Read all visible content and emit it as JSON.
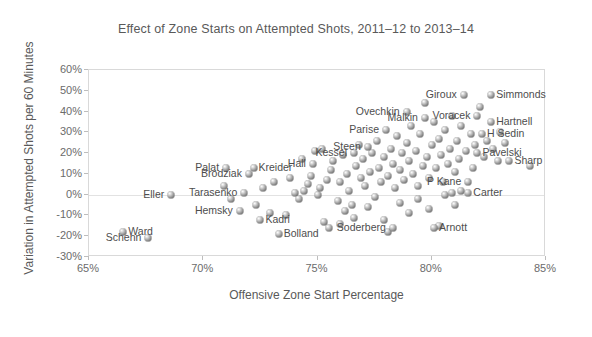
{
  "chart_data": {
    "type": "scatter",
    "title": "Effect of Zone Starts on Attempted Shots, 2011–12 to 2013–14",
    "xlabel": "Offensive Zone Start Percentage",
    "ylabel": "Variation in Attempted Shots per 60 Minutes",
    "xlim": [
      65,
      85
    ],
    "ylim": [
      -30,
      60
    ],
    "xticks": [
      "65%",
      "70%",
      "75%",
      "80%",
      "85%"
    ],
    "xtick_values": [
      65,
      70,
      75,
      80,
      85
    ],
    "yticks": [
      "60%",
      "50%",
      "40%",
      "30%",
      "20%",
      "10%",
      "0%",
      "-10%",
      "-20%",
      "-30%"
    ],
    "ytick_values": [
      60,
      50,
      40,
      30,
      20,
      10,
      0,
      -10,
      -20,
      -30
    ],
    "grid": "zero-line-only",
    "legend": "none",
    "marker_style": "grey-3d-sphere",
    "labeled_points": [
      {
        "name": "Ward",
        "x": 66.5,
        "y": -18,
        "side": "l"
      },
      {
        "name": "Schenn",
        "x": 67.6,
        "y": -21,
        "side": "r"
      },
      {
        "name": "Eller",
        "x": 68.6,
        "y": 0,
        "side": "r"
      },
      {
        "name": "Palat",
        "x": 71.0,
        "y": 13,
        "side": "r"
      },
      {
        "name": "Kreider",
        "x": 72.2,
        "y": 13,
        "side": "l"
      },
      {
        "name": "Brodziak",
        "x": 72.0,
        "y": 10,
        "side": "r"
      },
      {
        "name": "Tarasenko",
        "x": 71.8,
        "y": 1,
        "side": "r"
      },
      {
        "name": "Hemsky",
        "x": 71.6,
        "y": -8,
        "side": "r"
      },
      {
        "name": "Kadri",
        "x": 72.5,
        "y": -12,
        "side": "l"
      },
      {
        "name": "Bolland",
        "x": 73.3,
        "y": -19,
        "side": "l"
      },
      {
        "name": "Hall",
        "x": 74.8,
        "y": 15,
        "side": "r"
      },
      {
        "name": "Kessel",
        "x": 76.6,
        "y": 20,
        "side": "r"
      },
      {
        "name": "Steen",
        "x": 77.2,
        "y": 23,
        "side": "r"
      },
      {
        "name": "Parise",
        "x": 78.0,
        "y": 31,
        "side": "r"
      },
      {
        "name": "Ovechkin",
        "x": 78.9,
        "y": 40,
        "side": "r"
      },
      {
        "name": "Malkin",
        "x": 79.7,
        "y": 37,
        "side": "r"
      },
      {
        "name": "Soderberg",
        "x": 78.3,
        "y": -16,
        "side": "r"
      },
      {
        "name": "Arnott",
        "x": 80.1,
        "y": -16,
        "side": "l"
      },
      {
        "name": "Giroux",
        "x": 81.4,
        "y": 48,
        "side": "r"
      },
      {
        "name": "Simmonds",
        "x": 82.6,
        "y": 48,
        "side": "l"
      },
      {
        "name": "Voracek",
        "x": 82.0,
        "y": 38,
        "side": "r"
      },
      {
        "name": "Hartnell",
        "x": 82.6,
        "y": 35,
        "side": "l"
      },
      {
        "name": "H Sedin",
        "x": 82.2,
        "y": 29,
        "side": "l"
      },
      {
        "name": "Pavelski",
        "x": 82.0,
        "y": 20,
        "side": "l"
      },
      {
        "name": "Sharp",
        "x": 83.4,
        "y": 16,
        "side": "l"
      },
      {
        "name": "P Kane",
        "x": 81.6,
        "y": 6,
        "side": "r"
      },
      {
        "name": "Carter",
        "x": 81.6,
        "y": 1,
        "side": "l"
      }
    ],
    "unlabeled_points": [
      {
        "x": 72.6,
        "y": 3
      },
      {
        "x": 72.9,
        "y": -9
      },
      {
        "x": 73.6,
        "y": -10
      },
      {
        "x": 74.0,
        "y": 1
      },
      {
        "x": 74.2,
        "y": -2
      },
      {
        "x": 74.4,
        "y": 2
      },
      {
        "x": 74.6,
        "y": 5
      },
      {
        "x": 74.7,
        "y": 9
      },
      {
        "x": 74.9,
        "y": 21
      },
      {
        "x": 75.0,
        "y": 0
      },
      {
        "x": 75.1,
        "y": 3
      },
      {
        "x": 75.3,
        "y": -13
      },
      {
        "x": 75.4,
        "y": 7
      },
      {
        "x": 75.6,
        "y": 12
      },
      {
        "x": 75.7,
        "y": 16
      },
      {
        "x": 75.9,
        "y": -3
      },
      {
        "x": 76.0,
        "y": 6
      },
      {
        "x": 76.1,
        "y": 19
      },
      {
        "x": 76.3,
        "y": 10
      },
      {
        "x": 76.4,
        "y": 2
      },
      {
        "x": 76.5,
        "y": -5
      },
      {
        "x": 76.7,
        "y": 14
      },
      {
        "x": 76.8,
        "y": 24
      },
      {
        "x": 76.9,
        "y": 8
      },
      {
        "x": 77.0,
        "y": 17
      },
      {
        "x": 77.1,
        "y": 4
      },
      {
        "x": 77.3,
        "y": 11
      },
      {
        "x": 77.4,
        "y": 20
      },
      {
        "x": 77.5,
        "y": -1
      },
      {
        "x": 77.6,
        "y": 26
      },
      {
        "x": 77.7,
        "y": 13
      },
      {
        "x": 77.8,
        "y": 6
      },
      {
        "x": 77.9,
        "y": 18
      },
      {
        "x": 78.1,
        "y": 9
      },
      {
        "x": 78.2,
        "y": 22
      },
      {
        "x": 78.3,
        "y": 15
      },
      {
        "x": 78.4,
        "y": 3
      },
      {
        "x": 78.5,
        "y": 28
      },
      {
        "x": 78.6,
        "y": 12
      },
      {
        "x": 78.7,
        "y": 20
      },
      {
        "x": 78.8,
        "y": 7
      },
      {
        "x": 78.9,
        "y": 25
      },
      {
        "x": 79.0,
        "y": 16
      },
      {
        "x": 79.1,
        "y": 33
      },
      {
        "x": 79.2,
        "y": 10
      },
      {
        "x": 79.3,
        "y": 21
      },
      {
        "x": 79.4,
        "y": 4
      },
      {
        "x": 79.5,
        "y": 29
      },
      {
        "x": 79.6,
        "y": 14
      },
      {
        "x": 79.7,
        "y": 44
      },
      {
        "x": 79.8,
        "y": 18
      },
      {
        "x": 79.9,
        "y": 8
      },
      {
        "x": 80.0,
        "y": 24
      },
      {
        "x": 80.1,
        "y": 35
      },
      {
        "x": 80.2,
        "y": 13
      },
      {
        "x": 80.3,
        "y": 27
      },
      {
        "x": 80.4,
        "y": 19
      },
      {
        "x": 80.5,
        "y": 6
      },
      {
        "x": 80.6,
        "y": 31
      },
      {
        "x": 80.7,
        "y": 15
      },
      {
        "x": 80.8,
        "y": 22
      },
      {
        "x": 80.9,
        "y": 38
      },
      {
        "x": 81.0,
        "y": 11
      },
      {
        "x": 81.1,
        "y": 26
      },
      {
        "x": 81.2,
        "y": 17
      },
      {
        "x": 81.3,
        "y": 33
      },
      {
        "x": 81.5,
        "y": 21
      },
      {
        "x": 81.7,
        "y": 29
      },
      {
        "x": 81.8,
        "y": 13
      },
      {
        "x": 81.9,
        "y": 24
      },
      {
        "x": 82.1,
        "y": 42
      },
      {
        "x": 82.3,
        "y": 18
      },
      {
        "x": 82.4,
        "y": 26
      },
      {
        "x": 82.7,
        "y": 22
      },
      {
        "x": 83.0,
        "y": 30
      },
      {
        "x": 83.2,
        "y": 25
      },
      {
        "x": 84.3,
        "y": 14
      },
      {
        "x": 76.2,
        "y": -8
      },
      {
        "x": 76.6,
        "y": -11
      },
      {
        "x": 77.2,
        "y": -6
      },
      {
        "x": 77.9,
        "y": -12
      },
      {
        "x": 78.6,
        "y": -4
      },
      {
        "x": 79.0,
        "y": -9
      },
      {
        "x": 79.4,
        "y": -2
      },
      {
        "x": 79.9,
        "y": -7
      },
      {
        "x": 80.3,
        "y": -15
      },
      {
        "x": 80.6,
        "y": 0
      },
      {
        "x": 81.0,
        "y": -5
      },
      {
        "x": 81.3,
        "y": 2
      },
      {
        "x": 74.3,
        "y": 17
      },
      {
        "x": 75.2,
        "y": 22
      },
      {
        "x": 76.0,
        "y": -14
      },
      {
        "x": 73.1,
        "y": 6
      },
      {
        "x": 73.8,
        "y": 8
      },
      {
        "x": 72.3,
        "y": -5
      },
      {
        "x": 71.2,
        "y": -2
      },
      {
        "x": 70.9,
        "y": 4
      },
      {
        "x": 82.9,
        "y": 16
      },
      {
        "x": 80.9,
        "y": 1
      },
      {
        "x": 78.1,
        "y": -18
      },
      {
        "x": 75.5,
        "y": -16
      }
    ]
  }
}
